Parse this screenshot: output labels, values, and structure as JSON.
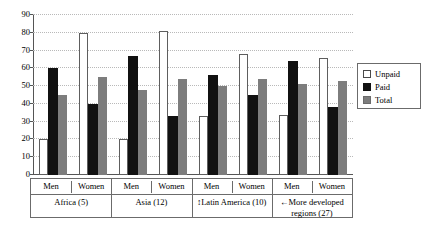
{
  "legend": {
    "position": "right",
    "entries": [
      {
        "label": "Unpaid",
        "swatch": "unpaid",
        "color": "#ffffff"
      },
      {
        "label": "Paid",
        "swatch": "paid",
        "color": "#111111"
      },
      {
        "label": "Total",
        "swatch": "total",
        "color": "#7d7d7d"
      }
    ]
  },
  "axis": {
    "y_ticks": [
      "0",
      "10",
      "20",
      "30",
      "40",
      "50",
      "60",
      "70",
      "80",
      "90"
    ],
    "gender_labels": [
      "Men",
      "Women",
      "Men",
      "Women",
      "Men",
      "Women",
      "Men",
      "Women"
    ],
    "region_labels": [
      "Africa (5)",
      "Asia (12)",
      "↕Latin America (10)",
      "←More developed regions (27)"
    ]
  },
  "chart_data": {
    "type": "bar",
    "title": "",
    "xlabel": "",
    "ylabel": "",
    "ylim": [
      0,
      90
    ],
    "ytick_step": 10,
    "grid": true,
    "legend_position": "right",
    "categories": [
      "Africa (5) - Men",
      "Africa (5) - Women",
      "Asia (12) - Men",
      "Asia (12) - Women",
      "Latin America (10) - Men",
      "Latin America (10) - Women",
      "More developed regions (27) - Men",
      "More developed regions (27) - Women"
    ],
    "groups": [
      {
        "region": "Africa (5)",
        "n": 5,
        "genders": [
          "Men",
          "Women"
        ]
      },
      {
        "region": "Asia (12)",
        "n": 12,
        "genders": [
          "Men",
          "Women"
        ]
      },
      {
        "region": "Latin America (10)",
        "n": 10,
        "genders": [
          "Men",
          "Women"
        ]
      },
      {
        "region": "More developed regions (27)",
        "n": 27,
        "genders": [
          "Men",
          "Women"
        ]
      }
    ],
    "series": [
      {
        "name": "Unpaid",
        "color": "#ffffff",
        "values": [
          20,
          80,
          20,
          81,
          33,
          68,
          34,
          66
        ]
      },
      {
        "name": "Paid",
        "color": "#111111",
        "values": [
          60,
          40,
          67,
          33,
          56,
          45,
          64,
          38
        ]
      },
      {
        "name": "Total",
        "color": "#7d7d7d",
        "values": [
          45,
          55,
          48,
          54,
          50,
          54,
          51,
          53
        ]
      }
    ]
  }
}
